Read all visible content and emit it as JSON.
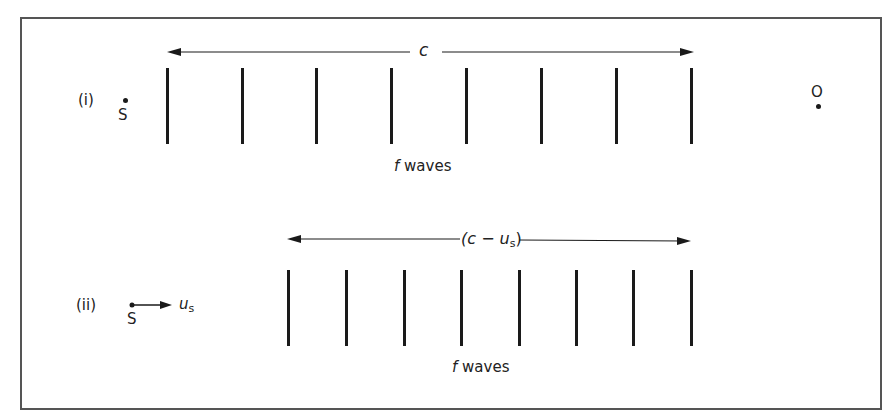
{
  "diagram": {
    "panels": [
      {
        "id": "i",
        "label": "(i)",
        "source_label": "S",
        "observer_label": "O",
        "span_label": "c",
        "waves_label_f": "f",
        "waves_label_text": "waves",
        "wave_count": 8
      },
      {
        "id": "ii",
        "label": "(ii)",
        "source_label": "S",
        "velocity_label": "u",
        "velocity_subscript": "s",
        "span_label_open": "(c − u",
        "span_label_subscript": "s",
        "span_label_close": ")",
        "waves_label_f": "f",
        "waves_label_text": "waves",
        "wave_count": 8
      }
    ],
    "colors": {
      "line": "#1a1a1a",
      "frame": "#555555",
      "background": "#ffffff"
    }
  }
}
